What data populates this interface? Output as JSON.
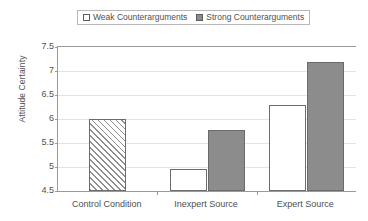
{
  "chart_data": {
    "type": "bar",
    "title": "",
    "xlabel": "",
    "ylabel": "Attitude Certainty",
    "ylim": [
      4.5,
      7.5
    ],
    "ytick_labels": [
      "7.5",
      "7",
      "6.5",
      "6",
      "5.5",
      "5",
      "4.5"
    ],
    "ytick_values": [
      7.5,
      7,
      6.5,
      6,
      5.5,
      5,
      4.5
    ],
    "grid": true,
    "legend_position": "top-center",
    "categories": [
      "Control Condition",
      "Inexpert Source",
      "Expert Source"
    ],
    "series": [
      {
        "name": "Weak Counterarguments",
        "style": "white-fill",
        "color": "#ffffff",
        "values": [
          null,
          4.95,
          6.3
        ]
      },
      {
        "name": "Strong Counterarguments",
        "style": "gray-fill",
        "color": "#8c8c8c",
        "values": [
          null,
          5.78,
          7.18
        ]
      },
      {
        "name": "Control",
        "style": "diagonal-hatch",
        "color": "#ffffff",
        "values": [
          6.0,
          null,
          null
        ]
      }
    ],
    "bars": [
      {
        "category": "Control Condition",
        "series": "Control",
        "value": 6.0,
        "style": "diagonal-hatch"
      },
      {
        "category": "Inexpert Source",
        "series": "Weak Counterarguments",
        "value": 4.95,
        "style": "white-fill"
      },
      {
        "category": "Inexpert Source",
        "series": "Strong Counterarguments",
        "value": 5.78,
        "style": "gray-fill"
      },
      {
        "category": "Expert Source",
        "series": "Weak Counterarguments",
        "value": 6.3,
        "style": "white-fill"
      },
      {
        "category": "Expert Source",
        "series": "Strong Counterarguments",
        "value": 7.18,
        "style": "gray-fill"
      }
    ]
  },
  "legend": {
    "entries": [
      {
        "label": "Weak Counterarguments",
        "swatch": "weak"
      },
      {
        "label": "Strong Counterarguments",
        "swatch": "strong"
      }
    ]
  },
  "axes": {
    "y_title": "Attitude Certainty"
  },
  "colors": {
    "strong_fill": "#8c8c8c",
    "weak_fill": "#ffffff",
    "bar_border": "#6b6b6b",
    "axis": "#9a9a9a",
    "grid": "#e4e4e4",
    "text": "#4f4f4f"
  }
}
